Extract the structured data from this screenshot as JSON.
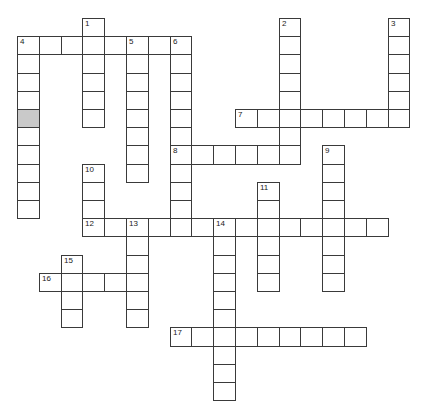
{
  "puzzle": {
    "grid": {
      "origin_x": 17,
      "origin_y": 18,
      "cell_width": 21.8,
      "cell_height": 18.2,
      "border_color": "#3a3a3a",
      "shaded_color": "#c9c9c9"
    },
    "shaded_cells": [
      [
        0,
        5
      ]
    ],
    "words": [
      {
        "number": "1",
        "direction": "down",
        "col": 3,
        "row": 0,
        "length": 6
      },
      {
        "number": "2",
        "direction": "down",
        "col": 12,
        "row": 0,
        "length": 8
      },
      {
        "number": "3",
        "direction": "down",
        "col": 17,
        "row": 0,
        "length": 6
      },
      {
        "number": "4",
        "direction": "across",
        "col": 0,
        "row": 1,
        "length": 8
      },
      {
        "number": "4",
        "direction": "down",
        "col": 0,
        "row": 1,
        "length": 10
      },
      {
        "number": "5",
        "direction": "down",
        "col": 5,
        "row": 1,
        "length": 8
      },
      {
        "number": "6",
        "direction": "down",
        "col": 7,
        "row": 1,
        "length": 11
      },
      {
        "number": "7",
        "direction": "across",
        "col": 10,
        "row": 5,
        "length": 8
      },
      {
        "number": "8",
        "direction": "across",
        "col": 7,
        "row": 7,
        "length": 6
      },
      {
        "number": "9",
        "direction": "down",
        "col": 14,
        "row": 7,
        "length": 8
      },
      {
        "number": "10",
        "direction": "down",
        "col": 3,
        "row": 8,
        "length": 4
      },
      {
        "number": "11",
        "direction": "down",
        "col": 11,
        "row": 9,
        "length": 6
      },
      {
        "number": "12",
        "direction": "across",
        "col": 3,
        "row": 11,
        "length": 14
      },
      {
        "number": "13",
        "direction": "down",
        "col": 5,
        "row": 11,
        "length": 6
      },
      {
        "number": "14",
        "direction": "down",
        "col": 9,
        "row": 11,
        "length": 10
      },
      {
        "number": "15",
        "direction": "down",
        "col": 2,
        "row": 13,
        "length": 4
      },
      {
        "number": "16",
        "direction": "across",
        "col": 1,
        "row": 14,
        "length": 5
      },
      {
        "number": "17",
        "direction": "across",
        "col": 7,
        "row": 17,
        "length": 9
      }
    ]
  }
}
